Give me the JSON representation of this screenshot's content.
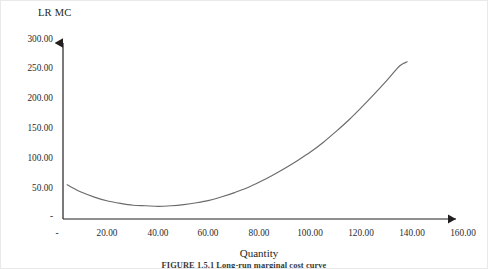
{
  "figure": {
    "caption": "FIGURE 1.5.1   Long-run marginal cost curve",
    "y_axis_title": "LR MC",
    "x_axis_title": "Quantity"
  },
  "colors": {
    "curve": "#6b6b6b",
    "axis": "#231f20",
    "text": "#2b2b2b",
    "background": "#ffffff"
  },
  "chart_data": {
    "type": "line",
    "title": "",
    "subtitle": "",
    "xlabel": "Quantity",
    "ylabel": "LR MC",
    "xlim": [
      0,
      160
    ],
    "ylim": [
      0,
      300
    ],
    "xticks": [
      "-",
      "20.00",
      "40.00",
      "60.00",
      "80.00",
      "100.00",
      "120.00",
      "140.00",
      "160.00"
    ],
    "xtick_values": [
      0,
      20,
      40,
      60,
      80,
      100,
      120,
      140,
      160
    ],
    "yticks": [
      "-",
      "50.00",
      "100.00",
      "150.00",
      "200.00",
      "250.00",
      "300.00"
    ],
    "ytick_values": [
      0,
      50,
      100,
      150,
      200,
      250,
      300
    ],
    "grid": false,
    "legend": null,
    "legend_position": "none",
    "series": [
      {
        "name": "LR MC",
        "color": "#6b6b6b",
        "x": [
          4,
          10,
          15,
          20,
          25,
          30,
          35,
          40,
          45,
          50,
          55,
          60,
          65,
          70,
          75,
          80,
          85,
          90,
          95,
          100,
          105,
          110,
          115,
          120,
          125,
          130,
          135,
          138
        ],
        "y": [
          57,
          44,
          36,
          30,
          26,
          23,
          22,
          21,
          22,
          24,
          27,
          31,
          37,
          44,
          52,
          62,
          73,
          85,
          98,
          112,
          128,
          146,
          165,
          186,
          208,
          231,
          255,
          262
        ]
      }
    ],
    "annotations": [
      {
        "label": "minimum",
        "x": 41,
        "y": 21
      }
    ]
  }
}
